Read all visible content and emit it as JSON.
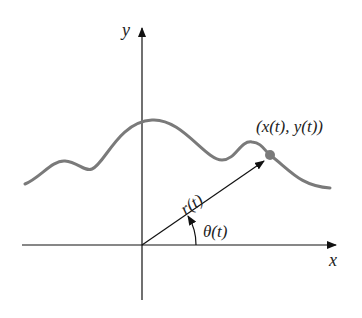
{
  "diagram": {
    "axes": {
      "x_label": "x",
      "y_label": "y"
    },
    "curve_color": "#7a7a7a",
    "point_label": "(x(t), y(t))",
    "radius_label": "r(t)",
    "angle_label": "θ(t)"
  }
}
